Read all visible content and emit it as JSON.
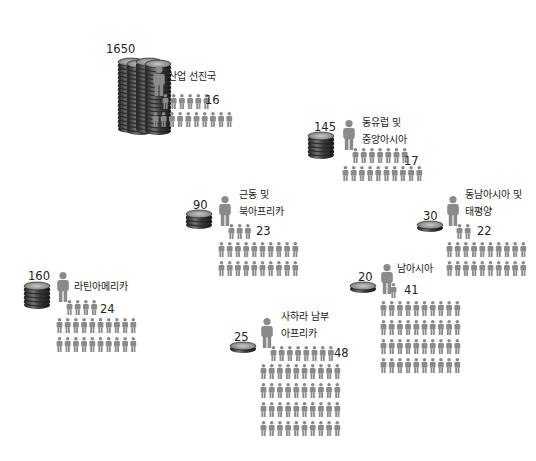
{
  "chart_data": {
    "type": "pictogram",
    "title": "",
    "series_labels": {
      "coins": "value (coin stack)",
      "people": "population count (person icons)"
    },
    "regions": [
      {
        "name": "산업 선진국",
        "coin_value": "1650",
        "people_value": "16",
        "coin_count": 1650,
        "people_count": 16,
        "people_first_row": 6,
        "people_rows_after": 1
      },
      {
        "name": "동유럽 및 중앙아시아",
        "coin_value": "145",
        "people_value": "17",
        "coin_count": 145,
        "people_count": 17,
        "people_first_row": 7,
        "people_rows_after": 1
      },
      {
        "name": "근동 및 북아프리카",
        "coin_value": "90",
        "people_value": "23",
        "coin_count": 90,
        "people_count": 23,
        "people_first_row": 3,
        "people_rows_after": 2
      },
      {
        "name": "동남아시아 및 태평양",
        "coin_value": "30",
        "people_value": "22",
        "coin_count": 30,
        "people_count": 22,
        "people_first_row": 2,
        "people_rows_after": 2
      },
      {
        "name": "남아시아",
        "coin_value": "20",
        "people_value": "41",
        "coin_count": 20,
        "people_count": 41,
        "people_first_row": 1,
        "people_rows_after": 4
      },
      {
        "name": "라틴아메리카",
        "coin_value": "160",
        "people_value": "24",
        "coin_count": 160,
        "people_count": 24,
        "people_first_row": 4,
        "people_rows_after": 2
      },
      {
        "name": "사하라 남부 아프리카",
        "coin_value": "25",
        "people_value": "48",
        "coin_count": 25,
        "people_count": 48,
        "people_first_row": 8,
        "people_rows_after": 4
      }
    ],
    "colors": {
      "person": "#8a8a8a",
      "coin_dark": "#2a2a2a",
      "coin_mid": "#6b6b6b",
      "coin_light": "#b5b5b5",
      "background": "#ffffff"
    }
  },
  "labels": {
    "r0": {
      "num": "1650",
      "name1": "산업 선진국",
      "name2": "",
      "pnum": "16"
    },
    "r1": {
      "num": "145",
      "name1": "동유럽 및",
      "name2": "중앙아시아",
      "pnum": "17"
    },
    "r2": {
      "num": "90",
      "name1": "근동 및",
      "name2": "북아프리카",
      "pnum": "23"
    },
    "r3": {
      "num": "30",
      "name1": "동남아시아 및",
      "name2": "태평양",
      "pnum": "22"
    },
    "r4": {
      "num": "20",
      "name1": "남아시아",
      "name2": "",
      "pnum": "41"
    },
    "r5": {
      "num": "160",
      "name1": "라틴아메리카",
      "name2": "",
      "pnum": "24"
    },
    "r6": {
      "num": "25",
      "name1": "사하라 남부",
      "name2": "아프리카",
      "pnum": "48"
    }
  }
}
